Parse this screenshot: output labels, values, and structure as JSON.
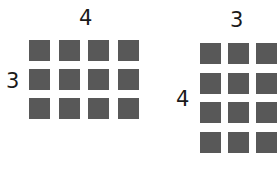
{
  "arrays": [
    {
      "name": "left-array",
      "top_label": "4",
      "side_label": "3",
      "rows": 3,
      "cols": 4,
      "origin": [
        29,
        40
      ],
      "step": [
        29.5,
        29
      ]
    },
    {
      "name": "right-array",
      "top_label": "3",
      "side_label": "4",
      "rows": 4,
      "cols": 3,
      "origin": [
        200,
        43
      ],
      "step": [
        28,
        29.5
      ]
    }
  ],
  "colors": {
    "square": "#585858",
    "text": "#1a1a1a"
  }
}
